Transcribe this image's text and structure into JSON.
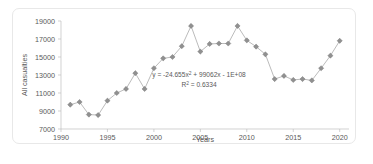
{
  "chart_data": {
    "type": "scatter",
    "title": "",
    "xlabel": "Years",
    "ylabel": "All casualties",
    "xlim": [
      1990,
      2021
    ],
    "ylim": [
      7000,
      19000
    ],
    "grid": false,
    "legend": "none",
    "x_ticks": [
      "1990",
      "1995",
      "2000",
      "2005",
      "2010",
      "2015",
      "2020"
    ],
    "x_tick_values": [
      1990,
      1995,
      2000,
      2005,
      2010,
      2015,
      2020
    ],
    "y_ticks": [
      "7000",
      "9000",
      "11000",
      "13000",
      "15000",
      "17000",
      "19000"
    ],
    "y_tick_values": [
      7000,
      9000,
      11000,
      13000,
      15000,
      17000,
      19000
    ],
    "marker_style": "diamond-with-cross",
    "connected": true,
    "x": [
      1991,
      1992,
      1993,
      1994,
      1995,
      1996,
      1997,
      1998,
      1999,
      2000,
      2001,
      2002,
      2003,
      2004,
      2005,
      2006,
      2007,
      2008,
      2009,
      2010,
      2011,
      2012,
      2013,
      2014,
      2015,
      2016,
      2017,
      2018,
      2019,
      2020
    ],
    "values": [
      9700,
      10000,
      8600,
      8550,
      10150,
      11000,
      11450,
      13200,
      11450,
      13750,
      14850,
      15000,
      16200,
      18450,
      15600,
      16450,
      16500,
      16500,
      18450,
      16850,
      16150,
      15300,
      12550,
      12900,
      12450,
      12550,
      12400,
      13750,
      15150,
      16800
    ],
    "series": [
      {
        "name": "All casualties",
        "values": [
          9700,
          10000,
          8600,
          8550,
          10150,
          11000,
          11450,
          13200,
          11450,
          13750,
          14850,
          15000,
          16200,
          18450,
          15600,
          16450,
          16500,
          16500,
          18450,
          16850,
          16150,
          15300,
          12550,
          12900,
          12450,
          12550,
          12400,
          13750,
          15150,
          16800
        ]
      }
    ],
    "trendline": {
      "type": "polynomial",
      "order": 2,
      "a": -24.655,
      "b": 99062,
      "c": -100000000,
      "equation": "y = -24.655x² + 99062x - 1E+08",
      "equation_prefix": "y = -24.655x",
      "equation_sup": "2",
      "equation_suffix": " + 99062x - 1E+08",
      "r_squared_prefix": "R",
      "r_squared_sup": "2",
      "r_squared_suffix": " = 0.6334",
      "r_squared_text": "R² = 0.6334",
      "r_squared_value": 0.6334,
      "domain": [
        1990.6,
        2021
      ]
    },
    "colors": {
      "marker": "#909090",
      "series_line": "#b3b3b3",
      "trend_line": "#4a4a4a",
      "axis": "#bfbfbf",
      "text": "#595959",
      "background": "#ffffff",
      "frame": "#e8e8e8"
    }
  }
}
